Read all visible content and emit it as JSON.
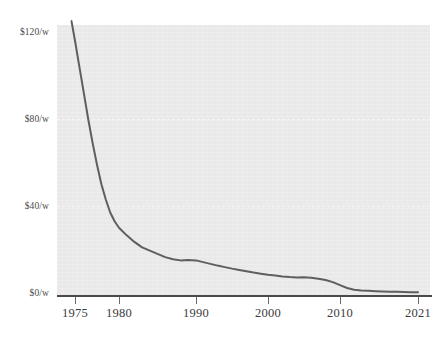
{
  "chart_data": {
    "type": "line",
    "title": "",
    "subtitle": "",
    "xlabel": "",
    "ylabel": "",
    "grid": true,
    "legend_position": "none",
    "xlim": [
      1974,
      2021
    ],
    "ylim": [
      0,
      126
    ],
    "y_tick_labels": [
      "$120/w",
      "$80/w",
      "$40/w",
      "$0/w"
    ],
    "y_tick_values": [
      120,
      80,
      40,
      0
    ],
    "x_tick_labels": [
      "1975",
      "1980",
      "1990",
      "2000",
      "2010",
      "2021"
    ],
    "x_tick_values": [
      1975,
      1980,
      1990,
      2000,
      2010,
      2021
    ],
    "gridline_values": [
      80,
      40
    ],
    "series": [
      {
        "name": "Solar photovoltaic module price",
        "color": "#5e5e5e",
        "x": [
          1974.6,
          1975,
          1975.5,
          1976,
          1976.5,
          1977,
          1977.5,
          1978,
          1978.5,
          1979,
          1979.5,
          1980,
          1981,
          1982,
          1983,
          1984,
          1985,
          1986,
          1987,
          1988,
          1989,
          1990,
          1991,
          1992,
          1993,
          1994,
          1995,
          1996,
          1997,
          1998,
          1999,
          2000,
          2001,
          2002,
          2003,
          2004,
          2005,
          2006,
          2007,
          2008,
          2009,
          2010,
          2011,
          2012,
          2013,
          2014,
          2015,
          2016,
          2017,
          2018,
          2019,
          2020,
          2021
        ],
        "y": [
          125,
          116,
          104,
          92,
          80,
          69,
          59,
          50,
          43,
          37,
          33,
          30,
          26.5,
          23.5,
          21,
          19.5,
          18,
          16.5,
          15.5,
          15,
          15.2,
          15,
          14.2,
          13.4,
          12.6,
          11.9,
          11.2,
          10.6,
          10.0,
          9.4,
          8.9,
          8.4,
          8.0,
          7.6,
          7.3,
          7.1,
          7.2,
          7.0,
          6.5,
          6.0,
          5.0,
          3.6,
          2.3,
          1.5,
          1.2,
          1.0,
          0.85,
          0.7,
          0.6,
          0.52,
          0.45,
          0.4,
          0.38
        ]
      }
    ]
  }
}
